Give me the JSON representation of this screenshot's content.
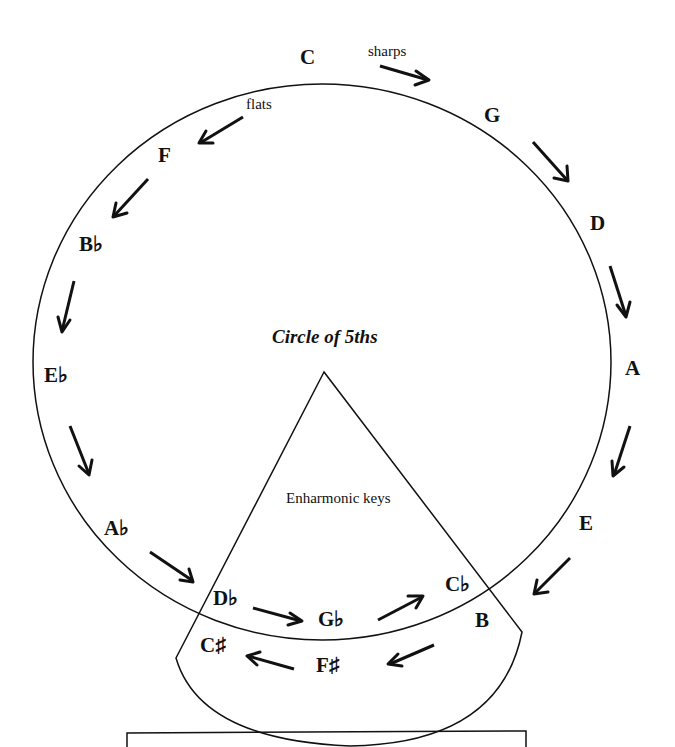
{
  "diagram": {
    "title": "Circle of 5ths",
    "sharps_label": "sharps",
    "flats_label": "flats",
    "enharmonic_label": "Enharmonic keys",
    "keys": {
      "c": "C",
      "g": "G",
      "d": "D",
      "a": "A",
      "e": "E",
      "b": "B",
      "cflat": "C♭",
      "gflat": "G♭",
      "dflat": "D♭",
      "fsharp": "F♯",
      "csharp": "C♯",
      "aflat": "A♭",
      "eflat": "E♭",
      "bflat": "B♭",
      "f": "F"
    },
    "sharp_sequence": [
      "C",
      "G",
      "D",
      "A",
      "E",
      "B",
      "F♯",
      "C♯"
    ],
    "flat_sequence": [
      "C",
      "F",
      "B♭",
      "E♭",
      "A♭",
      "D♭",
      "G♭",
      "C♭"
    ],
    "enharmonic_pairs": [
      [
        "B",
        "C♭"
      ],
      [
        "F♯",
        "G♭"
      ],
      [
        "C♯",
        "D♭"
      ]
    ],
    "caption_box": ""
  }
}
